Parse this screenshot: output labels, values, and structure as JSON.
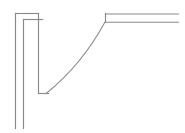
{
  "document": {
    "title": "Duct Elbow Line Drawing",
    "background_color": "#ffffff",
    "line_color": "#8a8a8a",
    "width": 185,
    "height": 133
  },
  "drawing": {
    "type": "technical-line-drawing",
    "subject": "rectangular duct elbow / curved transition",
    "stroke_color": "#8a8a8a",
    "stroke_width": 1.15,
    "geometry": {
      "vertical_duct": {
        "name": "vertical-duct-leg",
        "outer_wall_x": 15,
        "inner_wall_x": 23,
        "top_outer_y": 13,
        "top_inner_y": 19,
        "bottom_y": 128
      },
      "top_cap": {
        "name": "vertical-duct-top-cap",
        "outer_segment": {
          "x1": 15,
          "y1": 13,
          "x2": 38,
          "y2": 13
        },
        "inner_segment": {
          "x1": 23,
          "y1": 19,
          "x2": 42,
          "y2": 19
        }
      },
      "elbow_outer_corner": {
        "name": "elbow-outer-corner",
        "vertical": {
          "x1": 38,
          "y1": 13,
          "x2": 38,
          "y2": 93
        },
        "horizontal": {
          "x1": 38,
          "y1": 93,
          "x2": 48,
          "y2": 93
        }
      },
      "elbow_arc": {
        "name": "elbow-radius-arc",
        "start": {
          "x": 105,
          "y": 22
        },
        "end": {
          "x": 45,
          "y": 93
        },
        "control": {
          "x": 52,
          "y": 30
        },
        "radius_approx": 66,
        "sweep": "quarter-turn"
      },
      "horizontal_duct": {
        "name": "horizontal-duct-leg",
        "top_wall": {
          "x1": 105,
          "y1": 14,
          "x2": 178,
          "y2": 14
        },
        "bottom_wall": {
          "x1": 105,
          "y1": 22,
          "x2": 178,
          "y2": 22
        },
        "end_cap": {
          "x1": 105,
          "y1": 13,
          "x2": 105,
          "y2": 22
        },
        "right_edge_x": 178
      }
    }
  }
}
